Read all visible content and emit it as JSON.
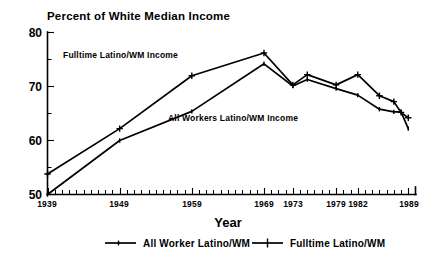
{
  "chart_data": {
    "type": "line",
    "title": "Percent of White Median Income",
    "xlabel": "Year",
    "ylabel": "",
    "xlim": [
      1939,
      1990
    ],
    "ylim": [
      50,
      80
    ],
    "grid": false,
    "legend_position": "bottom",
    "x_tick_labels": [
      "1939",
      "1949",
      "1959",
      "1969",
      "1973",
      "1979",
      "1982",
      "1989"
    ],
    "x_tick_values": [
      1939,
      1949,
      1959,
      1969,
      1973,
      1979,
      1982,
      1989
    ],
    "y_tick_labels": [
      "50",
      "60",
      "70",
      "80"
    ],
    "y_tick_values": [
      50,
      60,
      70,
      80
    ],
    "y_minor_ticks": [
      55,
      65,
      75
    ],
    "series": [
      {
        "name": "Fulltime Latino/WM",
        "marker": "plus",
        "x": [
          1939,
          1949,
          1959,
          1969,
          1973,
          1975,
          1979,
          1982,
          1985,
          1987,
          1988,
          1989
        ],
        "values": [
          53.8,
          62.2,
          72.0,
          76.2,
          70.3,
          72.2,
          70.3,
          72.2,
          68.3,
          67.2,
          65.2,
          64.2
        ]
      },
      {
        "name": "All Worker Latino/WM",
        "marker": "dot",
        "x": [
          1939,
          1949,
          1959,
          1969,
          1973,
          1975,
          1979,
          1982,
          1985,
          1987,
          1988,
          1989
        ],
        "values": [
          50.0,
          60.0,
          65.4,
          74.2,
          70.1,
          71.3,
          69.6,
          68.4,
          65.8,
          65.3,
          65.3,
          62.2
        ]
      }
    ],
    "annotations": [
      {
        "text": "Fulltime Latino/WM Income",
        "x": 1943.2,
        "y": 74.2
      },
      {
        "text": "All Workers Latino/WM Income",
        "x": 1956.6,
        "y": 63.0
      }
    ]
  },
  "legend": {
    "entries": [
      {
        "label": "All Worker Latino/WM",
        "marker": "dot"
      },
      {
        "label": "Fulltime Latino/WM",
        "marker": "plus"
      }
    ]
  },
  "colors": {
    "foreground": "#000000",
    "background": "#ffffff"
  }
}
